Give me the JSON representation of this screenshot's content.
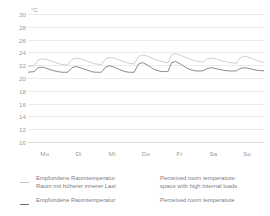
{
  "chart_data": {
    "type": "line",
    "title": "",
    "subtitle": "",
    "xlabel": "",
    "ylabel": "°C",
    "unit_label": "°C",
    "ylim": [
      10,
      30
    ],
    "yticks": [
      30,
      28,
      26,
      24,
      22,
      20,
      18,
      16,
      14,
      12,
      10
    ],
    "categories": [
      "Mo",
      "Di",
      "Mi",
      "Do",
      "Fr",
      "Sa",
      "So"
    ],
    "grid": true,
    "legend_position": "below",
    "series": [
      {
        "name": "Empfundene Raumtemperatur Raum mit höherer innerer Last",
        "name_en": "Perceived room temperature: space with high internal loads",
        "color": "#c3c3c3",
        "x": [
          0,
          0.18,
          0.3,
          0.42,
          0.55,
          0.72,
          0.88,
          1.0,
          1.18,
          1.3,
          1.42,
          1.55,
          1.72,
          1.88,
          2.0,
          2.18,
          2.3,
          2.42,
          2.55,
          2.72,
          2.88,
          3.0,
          3.15,
          3.28,
          3.4,
          3.55,
          3.72,
          3.88,
          4.0,
          4.15,
          4.26,
          4.38,
          4.55,
          4.72,
          4.88,
          5.0,
          5.18,
          5.32,
          5.46,
          5.62,
          5.8,
          6.0,
          6.18,
          6.3,
          6.45,
          6.62,
          6.8,
          7.0
        ],
        "values": [
          21.8,
          21.9,
          22.8,
          23.0,
          22.9,
          22.6,
          22.3,
          22.1,
          22.0,
          22.9,
          23.1,
          23.0,
          22.7,
          22.4,
          22.2,
          22.1,
          23.0,
          23.2,
          23.1,
          22.8,
          22.5,
          22.3,
          22.2,
          23.4,
          23.6,
          23.4,
          23.0,
          22.7,
          22.5,
          22.4,
          23.6,
          23.8,
          23.5,
          23.1,
          22.8,
          22.6,
          22.5,
          23.0,
          23.1,
          22.9,
          22.6,
          22.4,
          22.3,
          23.2,
          23.4,
          23.1,
          22.7,
          22.4
        ]
      },
      {
        "name": "Empfundene Raumtemperatur",
        "name_en": "Perceived room temperature",
        "color": "#6f6f6f",
        "x": [
          0,
          0.18,
          0.3,
          0.42,
          0.55,
          0.72,
          0.88,
          1.0,
          1.18,
          1.3,
          1.42,
          1.55,
          1.72,
          1.88,
          2.0,
          2.18,
          2.3,
          2.42,
          2.55,
          2.72,
          2.88,
          3.0,
          3.15,
          3.28,
          3.4,
          3.55,
          3.72,
          3.88,
          4.0,
          4.15,
          4.26,
          4.38,
          4.55,
          4.72,
          4.88,
          5.0,
          5.18,
          5.32,
          5.46,
          5.62,
          5.8,
          6.0,
          6.18,
          6.3,
          6.45,
          6.62,
          6.8,
          7.0
        ],
        "values": [
          20.9,
          21.0,
          21.6,
          21.7,
          21.5,
          21.2,
          21.0,
          20.9,
          20.9,
          21.6,
          21.8,
          21.6,
          21.3,
          21.0,
          20.9,
          20.9,
          21.7,
          21.9,
          21.7,
          21.3,
          21.0,
          20.9,
          20.9,
          22.2,
          22.4,
          22.0,
          21.4,
          21.1,
          21.0,
          21.0,
          22.4,
          22.6,
          22.1,
          21.5,
          21.2,
          21.1,
          21.1,
          21.5,
          21.6,
          21.4,
          21.2,
          21.1,
          21.1,
          21.5,
          21.6,
          21.4,
          21.2,
          21.1
        ]
      }
    ]
  },
  "legend": {
    "rows": [
      {
        "de": "Empfundene Raumtemperatur\nRaum mit höherer innerer Last",
        "de_line1": "Empfundene Raumtemperatur",
        "de_line2": "Raum mit höherer innerer Last",
        "en_line1": "Perceived room temperature:",
        "en_line2": "space with high internal loads",
        "color": "#c3c3c3"
      },
      {
        "de_line1": "Empfundene Raumtemperatur",
        "de_line2": "",
        "en_line1": "Perceived room temperature",
        "en_line2": "",
        "color": "#6f6f6f"
      }
    ]
  },
  "colors": {
    "grid": "#ececec",
    "axis": "#dcdcdc",
    "tick_text": "#9b9b9b",
    "legend_text": "#7d7d7d",
    "series_light": "#c3c3c3",
    "series_dark": "#6f6f6f",
    "background": "#ffffff"
  }
}
